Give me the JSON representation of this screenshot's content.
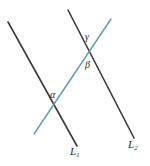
{
  "figure": {
    "background_color": "#ffffff",
    "width": 150,
    "height": 166,
    "line_color": "#3a3a3a",
    "transversal_color": "#5a9ea6",
    "label_color": "#2f2f2f",
    "labels": {
      "alpha": "α",
      "beta": "β",
      "gamma": "γ",
      "line1_base": "L",
      "line1_sub": "1",
      "line2_base": "L",
      "line2_sub": "2"
    },
    "lines": [
      {
        "name": "line-L1",
        "label": "L₁",
        "color": "#3a3a3a",
        "x1": 8,
        "y1": 22,
        "x2": 77,
        "y2": 146,
        "width": 1.6
      },
      {
        "name": "line-L2",
        "label": "L₂",
        "color": "#3a3a3a",
        "x1": 68,
        "y1": 10,
        "x2": 134,
        "y2": 138,
        "width": 1.6
      },
      {
        "name": "transversal",
        "label": "",
        "color": "#5a9ea6",
        "x1": 34,
        "y1": 134,
        "x2": 111,
        "y2": 19,
        "width": 1.4
      }
    ],
    "intersections": [
      {
        "name": "intersection-L1-transversal",
        "x": 55,
        "y": 105,
        "angle_label": "α"
      },
      {
        "name": "intersection-L2-transversal",
        "x": 88,
        "y": 51,
        "angle_labels": [
          "β",
          "γ"
        ]
      }
    ]
  }
}
